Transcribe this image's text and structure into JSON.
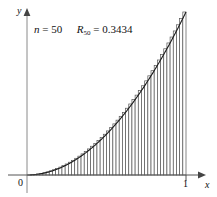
{
  "figure": {
    "name": "riemann-sum-right-endpoint",
    "background_color": "#ffffff",
    "ink_color": "#111111",
    "bar_edge_color": "#555555",
    "curve_color": "#1a1a1a"
  },
  "annotation": {
    "n_symbol": "n",
    "n_equals": "=",
    "n_value": "50",
    "r_symbol": "R",
    "r_subscript": "50",
    "r_equals": "=",
    "r_value": "0.3434",
    "full_text": "n = 50   R50 = 0.3434"
  },
  "axes": {
    "x_label": "x",
    "y_label": "y",
    "origin_label": "0",
    "x_tick_label": "1"
  },
  "chart_data": {
    "type": "area",
    "title": "",
    "subtitle": "",
    "xlabel": "x",
    "ylabel": "y",
    "xlim": [
      0,
      1
    ],
    "ylim": [
      0,
      1
    ],
    "grid": false,
    "legend": "none",
    "curve": {
      "name": "y = x^2",
      "exponent": 2,
      "x": [
        0,
        0.05,
        0.1,
        0.15,
        0.2,
        0.25,
        0.3,
        0.35,
        0.4,
        0.45,
        0.5,
        0.55,
        0.6,
        0.65,
        0.7,
        0.75,
        0.8,
        0.85,
        0.9,
        0.95,
        1
      ],
      "y": [
        0,
        0.0025,
        0.01,
        0.0225,
        0.04,
        0.0625,
        0.09,
        0.1225,
        0.16,
        0.2025,
        0.25,
        0.3025,
        0.36,
        0.4225,
        0.49,
        0.5625,
        0.64,
        0.7225,
        0.81,
        0.9025,
        1
      ]
    },
    "riemann": {
      "method": "right-endpoint",
      "n": 50,
      "interval": [
        0,
        1
      ],
      "delta_x": 0.02,
      "sum_value": 0.3434,
      "bar_right_edges": [
        0.02,
        0.04,
        0.06,
        0.08,
        0.1,
        0.12,
        0.14,
        0.16,
        0.18,
        0.2,
        0.22,
        0.24,
        0.26,
        0.28,
        0.3,
        0.32,
        0.34,
        0.36,
        0.38,
        0.4,
        0.42,
        0.44,
        0.46,
        0.48,
        0.5,
        0.52,
        0.54,
        0.56,
        0.58,
        0.6,
        0.62,
        0.64,
        0.66,
        0.68,
        0.7,
        0.72,
        0.74,
        0.76,
        0.78,
        0.8,
        0.82,
        0.84,
        0.86,
        0.88,
        0.9,
        0.92,
        0.94,
        0.96,
        0.98,
        1
      ],
      "bar_heights": [
        0.0004,
        0.0016,
        0.0036,
        0.0064,
        0.01,
        0.0144,
        0.0196,
        0.0256,
        0.0324,
        0.04,
        0.0484,
        0.0576,
        0.0676,
        0.0784,
        0.09,
        0.1024,
        0.1156,
        0.1296,
        0.1444,
        0.16,
        0.1764,
        0.1936,
        0.2116,
        0.2304,
        0.25,
        0.2704,
        0.2916,
        0.3136,
        0.3364,
        0.36,
        0.3844,
        0.4096,
        0.4356,
        0.4624,
        0.49,
        0.5184,
        0.5476,
        0.5776,
        0.6084,
        0.64,
        0.6724,
        0.7056,
        0.7396,
        0.7744,
        0.81,
        0.8464,
        0.8836,
        0.9216,
        0.9604,
        1
      ]
    }
  },
  "geometry": {
    "origin_px": [
      27,
      175
    ],
    "x_unit_px": 186,
    "plot_width_px": 159,
    "plot_height_px": 163,
    "y_axis_top_px": 10,
    "x_axis_right_px": 206
  }
}
